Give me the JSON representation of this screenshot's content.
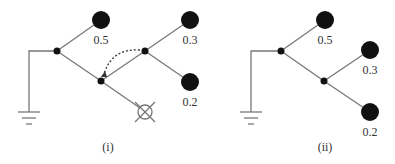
{
  "diagrams": [
    {
      "caption": "(i)",
      "leaves": [
        "0.5",
        "0.3",
        "0.2"
      ]
    },
    {
      "caption": "(ii)",
      "leaves": [
        "0.5",
        "0.3",
        "0.2"
      ]
    }
  ],
  "colors": {
    "line": "#777777",
    "node": "#111111"
  }
}
